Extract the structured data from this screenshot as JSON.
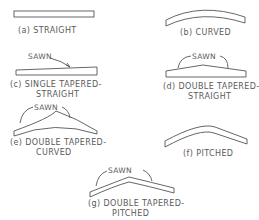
{
  "figure": {
    "stroke_color": "#555555",
    "text_color": "#5a5a5a",
    "sawn_label": "SAWN",
    "panels": [
      {
        "id": "a",
        "label": "(a) STRAIGHT"
      },
      {
        "id": "b",
        "label": "(b) CURVED"
      },
      {
        "id": "c",
        "label_line1": "(c) SINGLE TAPERED-",
        "label_line2": "STRAIGHT"
      },
      {
        "id": "d",
        "label_line1": "(d) DOUBLE TAPERED-",
        "label_line2": "STRAIGHT"
      },
      {
        "id": "e",
        "label_line1": "(e) DOUBLE TAPERED-",
        "label_line2": "CURVED"
      },
      {
        "id": "f",
        "label": "(f) PITCHED"
      },
      {
        "id": "g",
        "label_line1": "(g) DOUBLE TAPERED-",
        "label_line2": "PITCHED"
      }
    ]
  }
}
